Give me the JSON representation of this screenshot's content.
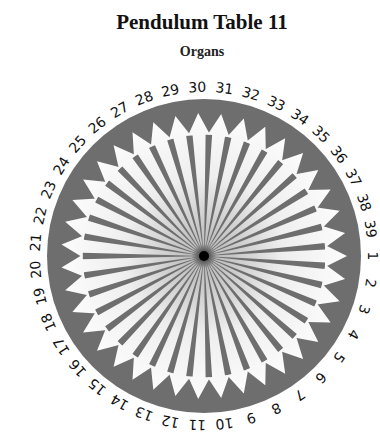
{
  "title": "Pendulum Table 11",
  "subtitle": "Organs",
  "chart": {
    "center": [
      204,
      256
    ],
    "radius": 157,
    "count": 39,
    "labels": [
      "1",
      "2",
      "3",
      "4",
      "5",
      "6",
      "7",
      "8",
      "9",
      "10",
      "11",
      "12",
      "13",
      "14",
      "15",
      "16",
      "17",
      "18",
      "19",
      "20",
      "21",
      "22",
      "23",
      "24",
      "25",
      "26",
      "27",
      "28",
      "29",
      "30",
      "31",
      "32",
      "33",
      "34",
      "35",
      "36",
      "37",
      "38",
      "39"
    ],
    "ring_color": "#6e6e6e",
    "arrow_color": "#ffffff"
  }
}
